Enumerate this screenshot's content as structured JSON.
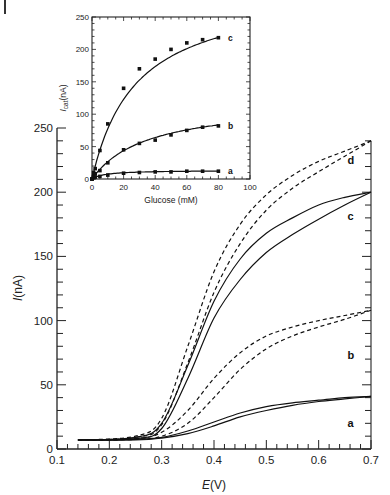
{
  "chart_data": [
    {
      "id": "main",
      "type": "line",
      "title": "",
      "xlabel": "E(V)",
      "ylabel": "I(nA)",
      "xlim": [
        0.1,
        0.7
      ],
      "ylim": [
        0,
        250
      ],
      "xticks": [
        "0.1",
        "0.2",
        "0.3",
        "0.4",
        "0.5",
        "0.6",
        "0.7"
      ],
      "yticks": [
        "0",
        "50",
        "100",
        "150",
        "200",
        "250"
      ],
      "grid": false,
      "series": [
        {
          "name": "a",
          "style": "solid",
          "label": "a",
          "forward": [
            [
              0.14,
              7
            ],
            [
              0.25,
              7.5
            ],
            [
              0.3,
              9
            ],
            [
              0.35,
              14
            ],
            [
              0.4,
              21
            ],
            [
              0.45,
              28
            ],
            [
              0.5,
              33
            ],
            [
              0.55,
              36
            ],
            [
              0.6,
              38
            ],
            [
              0.65,
              40
            ],
            [
              0.7,
              41
            ]
          ],
          "reverse": [
            [
              0.7,
              41
            ],
            [
              0.65,
              39
            ],
            [
              0.6,
              37
            ],
            [
              0.55,
              34
            ],
            [
              0.5,
              30
            ],
            [
              0.45,
              25
            ],
            [
              0.4,
              18
            ],
            [
              0.35,
              12
            ],
            [
              0.3,
              8.5
            ],
            [
              0.25,
              7
            ],
            [
              0.14,
              7
            ]
          ]
        },
        {
          "name": "b",
          "style": "dashed",
          "label": "b",
          "forward": [
            [
              0.14,
              7
            ],
            [
              0.25,
              8
            ],
            [
              0.3,
              13
            ],
            [
              0.35,
              30
            ],
            [
              0.4,
              55
            ],
            [
              0.45,
              75
            ],
            [
              0.5,
              88
            ],
            [
              0.55,
              95
            ],
            [
              0.6,
              100
            ],
            [
              0.65,
              104
            ],
            [
              0.7,
              108
            ]
          ],
          "reverse": [
            [
              0.7,
              108
            ],
            [
              0.65,
              101
            ],
            [
              0.6,
              95
            ],
            [
              0.55,
              88
            ],
            [
              0.5,
              78
            ],
            [
              0.45,
              62
            ],
            [
              0.4,
              40
            ],
            [
              0.35,
              20
            ],
            [
              0.3,
              10
            ],
            [
              0.25,
              7.5
            ],
            [
              0.14,
              7
            ]
          ]
        },
        {
          "name": "c",
          "style": "solid",
          "label": "c",
          "forward": [
            [
              0.14,
              7
            ],
            [
              0.25,
              9
            ],
            [
              0.3,
              20
            ],
            [
              0.35,
              65
            ],
            [
              0.4,
              115
            ],
            [
              0.45,
              148
            ],
            [
              0.5,
              168
            ],
            [
              0.55,
              180
            ],
            [
              0.6,
              190
            ],
            [
              0.65,
              196
            ],
            [
              0.7,
              200
            ]
          ],
          "reverse": [
            [
              0.7,
              200
            ],
            [
              0.65,
              190
            ],
            [
              0.6,
              179
            ],
            [
              0.55,
              167
            ],
            [
              0.5,
              153
            ],
            [
              0.45,
              132
            ],
            [
              0.4,
              102
            ],
            [
              0.35,
              55
            ],
            [
              0.3,
              16
            ],
            [
              0.25,
              8
            ],
            [
              0.14,
              7
            ]
          ]
        },
        {
          "name": "d",
          "style": "dashed",
          "label": "d",
          "forward": [
            [
              0.14,
              7
            ],
            [
              0.25,
              10
            ],
            [
              0.3,
              24
            ],
            [
              0.35,
              80
            ],
            [
              0.4,
              138
            ],
            [
              0.45,
              175
            ],
            [
              0.5,
              198
            ],
            [
              0.55,
              213
            ],
            [
              0.6,
              224
            ],
            [
              0.65,
              232
            ],
            [
              0.7,
              240
            ]
          ],
          "reverse": [
            [
              0.7,
              240
            ],
            [
              0.65,
              228
            ],
            [
              0.6,
              216
            ],
            [
              0.55,
              203
            ],
            [
              0.5,
              186
            ],
            [
              0.45,
              160
            ],
            [
              0.4,
              122
            ],
            [
              0.35,
              67
            ],
            [
              0.3,
              19
            ],
            [
              0.25,
              9
            ],
            [
              0.14,
              7
            ]
          ]
        }
      ],
      "curve_label_positions": {
        "a": [
          0.655,
          17
        ],
        "b": [
          0.655,
          70
        ],
        "c": [
          0.655,
          178
        ],
        "d": [
          0.655,
          222
        ]
      }
    },
    {
      "id": "inset",
      "type": "scatter",
      "title": "",
      "xlabel": "Glucose (mM)",
      "ylabel": "I_cat(nA)",
      "ylabel_main": "I",
      "ylabel_sub": "cat",
      "ylabel_unit": "(nA)",
      "xlim": [
        0,
        100
      ],
      "ylim": [
        0,
        250
      ],
      "xticks": [
        "0",
        "20",
        "40",
        "60",
        "80",
        "100"
      ],
      "yticks": [
        "0",
        "50",
        "100",
        "150",
        "200",
        "250"
      ],
      "grid": false,
      "series": [
        {
          "name": "a",
          "label": "a",
          "x": [
            0,
            1,
            2,
            5,
            10,
            20,
            30,
            40,
            50,
            60,
            70,
            80
          ],
          "y": [
            0,
            2,
            3,
            4,
            6,
            9,
            10,
            11,
            11,
            12,
            12,
            12
          ]
        },
        {
          "name": "b",
          "label": "b",
          "x": [
            0,
            1,
            2,
            5,
            10,
            20,
            30,
            40,
            50,
            60,
            70,
            80
          ],
          "y": [
            0,
            5,
            8,
            13,
            25,
            45,
            55,
            60,
            68,
            75,
            80,
            82
          ]
        },
        {
          "name": "c",
          "label": "c",
          "x": [
            0,
            1,
            2,
            5,
            10,
            20,
            30,
            40,
            50,
            60,
            70,
            80
          ],
          "y": [
            0,
            10,
            16,
            44,
            85,
            140,
            170,
            185,
            200,
            210,
            215,
            218
          ]
        }
      ],
      "fit_curves": {
        "a": {
          "vmax": 13.5,
          "km": 8
        },
        "b": {
          "vmax": 120,
          "km": 35
        },
        "c": {
          "vmax": 295,
          "km": 28
        }
      }
    }
  ],
  "labels": {
    "main_xlabel_italic": "E",
    "main_xlabel_rest": "(V)",
    "main_ylabel_italic": "I",
    "main_ylabel_rest": "(nA)",
    "inset_xlabel": "Glucose (mM)"
  }
}
